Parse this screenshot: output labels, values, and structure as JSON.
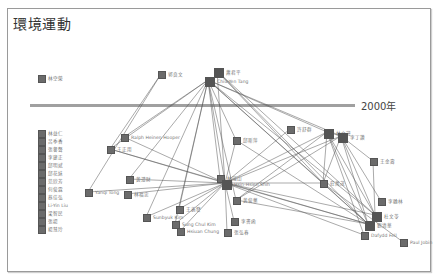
{
  "title": "環境運動",
  "divider_label": "2000年",
  "colors": {
    "node": "#666666",
    "edge": "#555555",
    "divider": "#a0a0a0",
    "border": "#9a9a9a"
  },
  "nodes": [
    {
      "id": "n0",
      "label": "林空榮",
      "x": 38,
      "y": 75,
      "big": false
    },
    {
      "id": "n1",
      "label": "郭良文",
      "x": 158,
      "y": 71,
      "big": false
    },
    {
      "id": "n2",
      "label": "蕭君平",
      "x": 214,
      "y": 68,
      "big": true
    },
    {
      "id": "n3",
      "label": "Chiu-Yen Tang",
      "x": 205,
      "y": 77,
      "big": true
    },
    {
      "id": "n4",
      "label": "林益仁",
      "x": 38,
      "y": 130,
      "big": false
    },
    {
      "id": "n5",
      "label": "呂季香",
      "x": 38,
      "y": 138,
      "big": false
    },
    {
      "id": "n6",
      "label": "張譽聲",
      "x": 38,
      "y": 146,
      "big": false
    },
    {
      "id": "n7",
      "label": "李建正",
      "x": 38,
      "y": 154,
      "big": false
    },
    {
      "id": "n8",
      "label": "邱明斌",
      "x": 38,
      "y": 162,
      "big": false
    },
    {
      "id": "n9",
      "label": "邱花妹",
      "x": 38,
      "y": 170,
      "big": false
    },
    {
      "id": "n10",
      "label": "范欣芳",
      "x": 38,
      "y": 178,
      "big": false
    },
    {
      "id": "n11",
      "label": "何俊霖",
      "x": 38,
      "y": 186,
      "big": false
    },
    {
      "id": "n12",
      "label": "蔡佳弘",
      "x": 38,
      "y": 194,
      "big": false
    },
    {
      "id": "n13",
      "label": "Li-Yin Liu",
      "x": 38,
      "y": 202,
      "big": false
    },
    {
      "id": "n14",
      "label": "梁智民",
      "x": 38,
      "y": 210,
      "big": false
    },
    {
      "id": "n15",
      "label": "張揚",
      "x": 38,
      "y": 218,
      "big": false
    },
    {
      "id": "n16",
      "label": "楊慧玲",
      "x": 38,
      "y": 226,
      "big": false
    },
    {
      "id": "n17",
      "label": "Ralph Heinen Hooper",
      "x": 121,
      "y": 134,
      "big": false
    },
    {
      "id": "n18",
      "label": "王正用",
      "x": 107,
      "y": 146,
      "big": false
    },
    {
      "id": "n19",
      "label": "黃澄財",
      "x": 126,
      "y": 176,
      "big": false
    },
    {
      "id": "n20",
      "label": "Yanqi Tong",
      "x": 85,
      "y": 189,
      "big": false
    },
    {
      "id": "n21",
      "label": "林福忠",
      "x": 124,
      "y": 191,
      "big": false
    },
    {
      "id": "n22",
      "label": "邱斯萍",
      "x": 233,
      "y": 137,
      "big": false
    },
    {
      "id": "n23",
      "label": "許舒群",
      "x": 287,
      "y": 126,
      "big": false
    },
    {
      "id": "n24",
      "label": "林文灣",
      "x": 324,
      "y": 129,
      "big": true
    },
    {
      "id": "n25",
      "label": "李丁讚",
      "x": 338,
      "y": 133,
      "big": true
    },
    {
      "id": "n26",
      "label": "王金壽",
      "x": 370,
      "y": 158,
      "big": false
    },
    {
      "id": "n27",
      "label": "林瑞山",
      "x": 217,
      "y": 175,
      "big": false
    },
    {
      "id": "n28",
      "label": "Hsin-Hsien Shih",
      "x": 222,
      "y": 180,
      "big": true
    },
    {
      "id": "n29",
      "label": "莊萬茂",
      "x": 320,
      "y": 180,
      "big": false
    },
    {
      "id": "n30",
      "label": "黃俊藝",
      "x": 233,
      "y": 197,
      "big": false
    },
    {
      "id": "n31",
      "label": "王義發",
      "x": 176,
      "y": 206,
      "big": false
    },
    {
      "id": "n32",
      "label": "Sunbyuk Kim",
      "x": 143,
      "y": 214,
      "big": false
    },
    {
      "id": "n33",
      "label": "Sung Chul Kim",
      "x": 172,
      "y": 221,
      "big": false
    },
    {
      "id": "n34",
      "label": "Hsiuan Chung",
      "x": 177,
      "y": 228,
      "big": false
    },
    {
      "id": "n35",
      "label": "李書函",
      "x": 231,
      "y": 218,
      "big": false
    },
    {
      "id": "n36",
      "label": "張弘春",
      "x": 224,
      "y": 229,
      "big": false
    },
    {
      "id": "n37",
      "label": "Paul Jobin",
      "x": 400,
      "y": 239,
      "big": false
    },
    {
      "id": "n38",
      "label": "李翰林",
      "x": 378,
      "y": 198,
      "big": false
    },
    {
      "id": "n39",
      "label": "杜文苓",
      "x": 372,
      "y": 212,
      "big": true
    },
    {
      "id": "n40",
      "label": "劉清華",
      "x": 365,
      "y": 221,
      "big": true
    },
    {
      "id": "n41",
      "label": "Dafydd Fell",
      "x": 361,
      "y": 232,
      "big": false
    }
  ],
  "edges": [
    [
      "n1",
      "n18"
    ],
    [
      "n1",
      "n20"
    ],
    [
      "n3",
      "n17"
    ],
    [
      "n3",
      "n18"
    ],
    [
      "n3",
      "n19"
    ],
    [
      "n3",
      "n22"
    ],
    [
      "n3",
      "n28"
    ],
    [
      "n3",
      "n31"
    ],
    [
      "n3",
      "n32"
    ],
    [
      "n3",
      "n33"
    ],
    [
      "n3",
      "n24"
    ],
    [
      "n3",
      "n25"
    ],
    [
      "n3",
      "n29"
    ],
    [
      "n3",
      "n39"
    ],
    [
      "n3",
      "n40"
    ],
    [
      "n3",
      "n27"
    ],
    [
      "n3",
      "n30"
    ],
    [
      "n2",
      "n28"
    ],
    [
      "n2",
      "n29"
    ],
    [
      "n2",
      "n40"
    ],
    [
      "n2",
      "n39"
    ],
    [
      "n17",
      "n28"
    ],
    [
      "n18",
      "n40"
    ],
    [
      "n18",
      "n28"
    ],
    [
      "n19",
      "n28"
    ],
    [
      "n20",
      "n28"
    ],
    [
      "n21",
      "n28"
    ],
    [
      "n22",
      "n28"
    ],
    [
      "n22",
      "n40"
    ],
    [
      "n23",
      "n28"
    ],
    [
      "n24",
      "n28"
    ],
    [
      "n25",
      "n28"
    ],
    [
      "n24",
      "n30"
    ],
    [
      "n25",
      "n30"
    ],
    [
      "n24",
      "n39"
    ],
    [
      "n24",
      "n40"
    ],
    [
      "n25",
      "n39"
    ],
    [
      "n25",
      "n40"
    ],
    [
      "n25",
      "n26"
    ],
    [
      "n26",
      "n39"
    ],
    [
      "n24",
      "n41"
    ],
    [
      "n25",
      "n38"
    ],
    [
      "n27",
      "n28"
    ],
    [
      "n29",
      "n24"
    ],
    [
      "n29",
      "n25"
    ],
    [
      "n29",
      "n40"
    ],
    [
      "n28",
      "n39"
    ],
    [
      "n28",
      "n40"
    ],
    [
      "n28",
      "n41"
    ],
    [
      "n28",
      "n29"
    ],
    [
      "n31",
      "n28"
    ],
    [
      "n32",
      "n28"
    ],
    [
      "n33",
      "n28"
    ],
    [
      "n34",
      "n28"
    ],
    [
      "n35",
      "n28"
    ],
    [
      "n36",
      "n28"
    ],
    [
      "n37",
      "n29"
    ],
    [
      "n30",
      "n40"
    ],
    [
      "n24",
      "n25"
    ]
  ]
}
